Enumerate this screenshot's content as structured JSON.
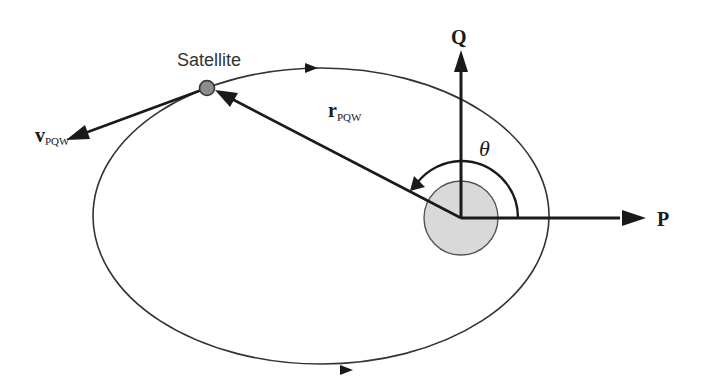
{
  "diagram": {
    "colors": {
      "stroke": "#1a1a1a",
      "orbit": "#333333",
      "earth_fill": "#d9d9d9",
      "earth_stroke": "#555555",
      "satellite_fill": "#8c8c8c",
      "background": "#ffffff"
    },
    "labels": {
      "satellite": "Satellite",
      "velocity_main": "v",
      "velocity_sub": "PQW",
      "position_main": "r",
      "position_sub": "PQW",
      "axis_q": "Q",
      "axis_p": "P",
      "angle": "θ"
    },
    "elements": {
      "orbit": "ellipse (direction counter-clockwise)",
      "central_body": "Earth (focus of orbit)",
      "satellite": "point on orbit",
      "vectors": [
        "position vector r_PQW",
        "velocity vector v_PQW",
        "P axis",
        "Q axis"
      ],
      "angle": "true anomaly θ measured from P axis"
    }
  }
}
